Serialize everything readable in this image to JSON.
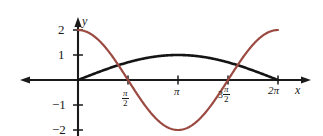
{
  "chart_data": {
    "type": "line",
    "title": "",
    "xlabel": "x",
    "ylabel": "y",
    "xlim": [
      -1.8,
      7.1
    ],
    "ylim": [
      -2.6,
      2.35
    ],
    "grid": false,
    "legend": "none",
    "x_tick_labels": [
      "π/2",
      "π",
      "3π/2",
      "2π"
    ],
    "x_tick_values": [
      1.5708,
      3.1416,
      4.7124,
      6.2832
    ],
    "y_tick_labels": [
      "2",
      "1",
      "−1",
      "−2"
    ],
    "y_tick_values": [
      2,
      1,
      -1,
      -2
    ],
    "series": [
      {
        "name": "y = 2cos(x)",
        "color": "#9b4a42",
        "equation": "2*cos(x)",
        "domain": [
          0,
          6.2832
        ],
        "key_points": [
          {
            "x": 0,
            "y": 2
          },
          {
            "x": 1.5708,
            "y": 0
          },
          {
            "x": 3.1416,
            "y": -2
          },
          {
            "x": 4.7124,
            "y": 0
          },
          {
            "x": 6.2832,
            "y": 2
          }
        ]
      },
      {
        "name": "y = sin(x/2)",
        "color": "#141414",
        "equation": "sin(x/2)",
        "domain": [
          0,
          6.2832
        ],
        "key_points": [
          {
            "x": 0,
            "y": 0
          },
          {
            "x": 1.5708,
            "y": 0.7071
          },
          {
            "x": 3.1416,
            "y": 1
          },
          {
            "x": 4.7124,
            "y": 0.7071
          },
          {
            "x": 6.2832,
            "y": 0
          }
        ]
      }
    ]
  },
  "axes": {
    "x_axis_name": "x",
    "y_axis_name": "y"
  },
  "ticks": {
    "y": [
      {
        "label": "2",
        "value": 2
      },
      {
        "label": "1",
        "value": 1
      },
      {
        "label": "−1",
        "value": -1
      },
      {
        "label": "−2",
        "value": -2
      }
    ],
    "x": [
      {
        "label_num": "π",
        "label_den": "2",
        "prefix": "",
        "value": 1.5708
      },
      {
        "label_plain": "π",
        "value": 3.1416
      },
      {
        "label_num": "π",
        "label_den": "2",
        "prefix": "3",
        "value": 4.7124
      },
      {
        "label_plain": "2π",
        "value": 6.2832
      }
    ]
  },
  "colors": {
    "curve_red": "#9b4a42",
    "curve_black": "#141414",
    "axis": "#1a1a1a"
  }
}
